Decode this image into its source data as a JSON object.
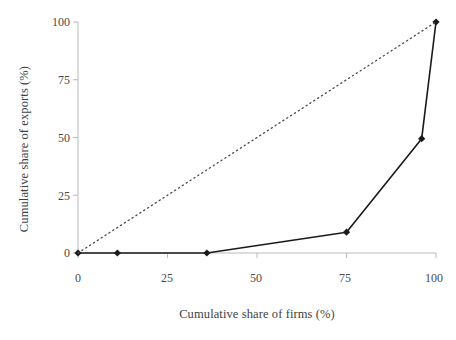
{
  "chart_data": {
    "type": "line",
    "title": "",
    "subtitle": "",
    "xlabel": "Cumulative share of firms (%)",
    "ylabel": "Cumulative share of exports (%)",
    "xlim": [
      0,
      100
    ],
    "ylim": [
      0,
      100
    ],
    "xticks": [
      0,
      25,
      50,
      75,
      100
    ],
    "yticks": [
      0,
      25,
      50,
      75,
      100
    ],
    "xtick_labels": [
      "0",
      "25",
      "50",
      "75",
      "100"
    ],
    "ytick_labels": [
      "0",
      "25",
      "50",
      "75",
      "100"
    ],
    "grid": false,
    "legend": false,
    "legend_position": "none",
    "series": [
      {
        "name": "Lorenz curve of export concentration",
        "style": "solid",
        "marker": "diamond",
        "color": "#1a1a1a",
        "x": [
          0,
          11,
          36,
          75,
          96,
          100
        ],
        "y": [
          0,
          0,
          0,
          9,
          49.5,
          100
        ]
      },
      {
        "name": "Line of perfect equality",
        "style": "dotted",
        "marker": "none",
        "color": "#4a4a4a",
        "x": [
          0,
          100
        ],
        "y": [
          0,
          100
        ]
      }
    ],
    "annotations": []
  },
  "axes": {
    "y_title": "Cumulative share of exports (%)",
    "x_title": "Cumulative share of firms (%)",
    "y_ticks": [
      "100",
      "75",
      "50",
      "25",
      "0"
    ],
    "x_ticks": [
      "0",
      "25",
      "50",
      "75",
      "100"
    ],
    "axis_color": "#b9b9b9"
  },
  "page": {
    "corner_mark": ""
  }
}
